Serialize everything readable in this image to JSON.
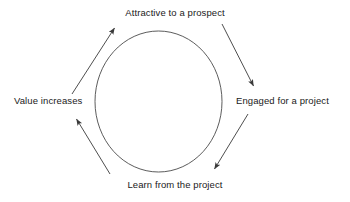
{
  "diagram": {
    "type": "cycle-diagram",
    "stroke_color": "#3a3a3a",
    "text_color": "#1a1a1a",
    "background_color": "#ffffff",
    "circle": {
      "name": "center-circle",
      "cx": 158.5,
      "cy": 101.5,
      "rx": 64,
      "ry": 70
    },
    "nodes": [
      {
        "id": "attractive",
        "label": "Attractive to a prospect",
        "position": "top"
      },
      {
        "id": "engaged",
        "label": "Engaged for a project",
        "position": "right"
      },
      {
        "id": "learn",
        "label": "Learn from the project",
        "position": "bottom"
      },
      {
        "id": "value",
        "label": "Value increases",
        "position": "left"
      }
    ],
    "arrows": [
      {
        "id": "attractive-to-engaged",
        "from": "attractive",
        "to": "engaged",
        "direction": "down-right"
      },
      {
        "id": "engaged-to-learn",
        "from": "engaged",
        "to": "learn",
        "direction": "down-left"
      },
      {
        "id": "learn-to-value",
        "from": "learn",
        "to": "value",
        "direction": "up-left"
      },
      {
        "id": "value-to-attractive",
        "from": "value",
        "to": "attractive",
        "direction": "up-right"
      }
    ]
  }
}
